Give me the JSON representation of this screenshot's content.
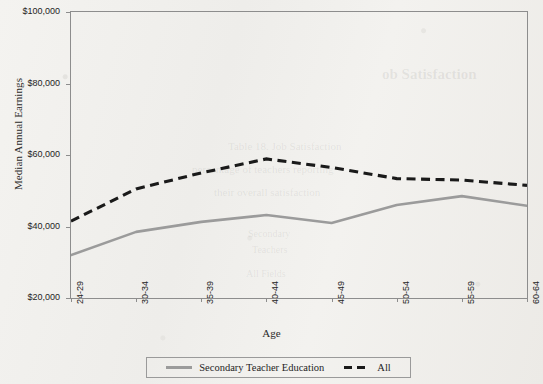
{
  "chart_data": {
    "type": "line",
    "title": "",
    "xlabel": "Age",
    "ylabel": "Median Annual Earnings",
    "categories": [
      "24-29",
      "30-34",
      "35-39",
      "40-44",
      "45-49",
      "50-54",
      "55-59",
      "60-64"
    ],
    "ylim": [
      20000,
      100000
    ],
    "ytick_labels": [
      "$100,000",
      "$80,000",
      "$60,000",
      "$40,000",
      "$20,000"
    ],
    "ytick_values": [
      100000,
      80000,
      60000,
      40000,
      20000
    ],
    "grid": false,
    "legend_position": "bottom",
    "series": [
      {
        "name": "Secondary Teacher Education",
        "style": "solid",
        "color": "#9b9b9b",
        "values": [
          32000,
          38500,
          41300,
          43200,
          41000,
          46000,
          48500,
          45800
        ]
      },
      {
        "name": "All",
        "style": "dashed",
        "color": "#1a1a1a",
        "values": [
          41500,
          50500,
          55000,
          58900,
          56500,
          53400,
          53000,
          51500
        ]
      }
    ]
  },
  "legend": {
    "entries": [
      {
        "label": "Secondary Teacher Education"
      },
      {
        "label": "All"
      }
    ]
  },
  "ghost_text": {
    "heading": "ob Satisfaction",
    "line1": "Table 18. Job Satisfaction",
    "line2": "percentage of teachers reporting",
    "line3": "their overall satisfaction",
    "line4": "Secondary",
    "line5": "Teachers",
    "line6": "All Fields"
  }
}
